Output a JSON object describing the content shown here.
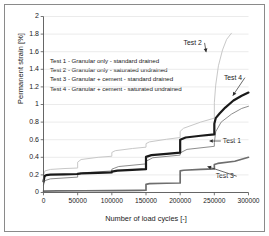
{
  "chart_data": {
    "type": "line",
    "title": "",
    "xlabel": "Number of load cycles [-]",
    "ylabel": "Permanent strain [%]",
    "xlim": [
      0,
      300000
    ],
    "ylim": [
      0,
      2
    ],
    "xticks": [
      "0",
      "50000",
      "100000",
      "150000",
      "200000",
      "250000",
      "300000"
    ],
    "xtick_values": [
      0,
      50000,
      100000,
      150000,
      200000,
      250000,
      300000
    ],
    "yticks": [
      "0",
      "0.2",
      "0.4",
      "0.6",
      "0.8",
      "1",
      "1.2",
      "1.4",
      "1.6",
      "1.8",
      "2"
    ],
    "ytick_values": [
      0,
      0.2,
      0.4,
      0.6,
      0.8,
      1.0,
      1.2,
      1.4,
      1.6,
      1.8,
      2.0
    ],
    "grid": "horizontal",
    "legend_position": "upper-left-inside",
    "series": [
      {
        "name": "Test 1",
        "label": "Test 1 - Granular only - standard drained",
        "color": "#707070",
        "width": 0.8,
        "x": [
          0,
          2000,
          10000,
          30000,
          50000,
          50000,
          60000,
          100000,
          100000,
          110000,
          150000,
          150000,
          160000,
          200000,
          200000,
          210000,
          250000,
          250000,
          252000,
          260000,
          275000,
          290000,
          300000
        ],
        "y": [
          0.085,
          0.135,
          0.155,
          0.165,
          0.175,
          0.205,
          0.225,
          0.245,
          0.265,
          0.295,
          0.325,
          0.355,
          0.395,
          0.425,
          0.45,
          0.49,
          0.525,
          0.565,
          0.69,
          0.8,
          0.89,
          0.955,
          0.98
        ]
      },
      {
        "name": "Test 2",
        "label": "Test 2 - Granular only - saturated undrained",
        "color": "#c8c8c8",
        "width": 1.0,
        "x": [
          0,
          2000,
          10000,
          30000,
          50000,
          50000,
          55000,
          80000,
          100000,
          100000,
          105000,
          130000,
          150000,
          150000,
          155000,
          180000,
          200000,
          200000,
          205000,
          230000,
          250000,
          250000,
          252000,
          256000,
          262000,
          268000,
          275000
        ],
        "y": [
          0.19,
          0.245,
          0.262,
          0.272,
          0.278,
          0.345,
          0.375,
          0.4,
          0.412,
          0.455,
          0.475,
          0.5,
          0.515,
          0.555,
          0.575,
          0.605,
          0.625,
          0.695,
          0.73,
          0.8,
          0.845,
          1.02,
          1.22,
          1.44,
          1.62,
          1.74,
          1.81
        ]
      },
      {
        "name": "Test 3",
        "label": "Test 3 - Granular + cement - standard drained",
        "color": "#6e6e6e",
        "width": 1.7,
        "x": [
          0,
          20000,
          60000,
          100000,
          140000,
          150000,
          150000,
          155000,
          180000,
          200000,
          200000,
          205000,
          230000,
          250000,
          250000,
          255000,
          280000,
          300000
        ],
        "y": [
          0.015,
          0.018,
          0.02,
          0.022,
          0.024,
          0.026,
          0.093,
          0.1,
          0.105,
          0.108,
          0.245,
          0.253,
          0.262,
          0.268,
          0.318,
          0.33,
          0.355,
          0.4
        ]
      },
      {
        "name": "Test 4",
        "label": "Test 4 - Granular + cement - saturated undrained",
        "color": "#1a1a1a",
        "width": 2.2,
        "x": [
          0,
          1500,
          4000,
          10000,
          30000,
          50000,
          50000,
          55000,
          80000,
          100000,
          100000,
          108000,
          130000,
          150000,
          150000,
          158000,
          180000,
          200000,
          200000,
          208000,
          230000,
          250000,
          250000,
          252000,
          258000,
          266000,
          278000,
          290000,
          300000
        ],
        "y": [
          0.125,
          0.185,
          0.198,
          0.203,
          0.207,
          0.21,
          0.212,
          0.218,
          0.224,
          0.228,
          0.238,
          0.248,
          0.258,
          0.265,
          0.405,
          0.425,
          0.44,
          0.452,
          0.6,
          0.625,
          0.645,
          0.66,
          0.78,
          0.845,
          0.9,
          0.965,
          1.045,
          1.1,
          1.135
        ]
      }
    ],
    "annotations": [
      {
        "name": "Test 2",
        "text": "Test 2",
        "x": 205000,
        "y": 1.7,
        "leader_to_x": 238000,
        "leader_to_y": 1.595
      },
      {
        "name": "Test 4",
        "text": "Test 4",
        "x": 264000,
        "y": 1.305,
        "leader_to_x": 277000,
        "leader_to_y": 1.1
      },
      {
        "name": "Test 1",
        "text": "Test 1",
        "x": 258000,
        "y": 0.585,
        "leader_to_x": 243000,
        "leader_to_y": 0.585,
        "arrow": "left"
      },
      {
        "name": "Test 3",
        "text": "Test 3",
        "x": 252000,
        "y": 0.185,
        "leader_to_x": 240000,
        "leader_to_y": 0.295
      }
    ]
  },
  "legend": {
    "entries": [
      "Test 1 - Granular only - standard drained",
      "Test 2 - Granular only - saturated undrained",
      "Test 3 - Granular + cement - standard drained",
      "Test 4 - Granular + cement - saturated undrained"
    ]
  },
  "style": {
    "axis_color": "#555555",
    "grid_color": "#e2e2e2",
    "frame_color": "#8a8a8a",
    "text_color": "#1a1a1a",
    "background": "#ffffff"
  }
}
